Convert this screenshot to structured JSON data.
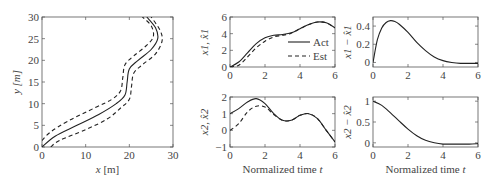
{
  "chart_data": [
    {
      "id": "trajectory",
      "type": "line",
      "xlabel": "x [m]",
      "ylabel": "y [m]",
      "xlim": [
        0,
        30
      ],
      "ylim": [
        0,
        30
      ],
      "xticks": [
        "0",
        "10",
        "20",
        "30"
      ],
      "yticks": [
        "0",
        "5",
        "10",
        "15",
        "20",
        "25",
        "30"
      ],
      "series": [
        {
          "name": "center",
          "style": "solid",
          "x": [
            0,
            3,
            8,
            13,
            17,
            19,
            19.5,
            20,
            22,
            25,
            26.5,
            26,
            24
          ],
          "y": [
            0,
            2.5,
            5,
            7.5,
            10,
            12,
            15,
            18,
            20,
            22.5,
            25,
            27.5,
            30
          ]
        },
        {
          "name": "left-bound",
          "style": "dashed",
          "x": [
            0,
            2,
            6,
            12,
            16,
            18,
            18.5,
            19,
            21,
            24,
            25.5,
            25,
            23
          ],
          "y": [
            1.5,
            3.5,
            6,
            9,
            11,
            13,
            16,
            19,
            21,
            23.5,
            25.5,
            28,
            30
          ]
        },
        {
          "name": "right-bound",
          "style": "dashed",
          "x": [
            2,
            4,
            10,
            15,
            18,
            20,
            20.5,
            21,
            23,
            26,
            27.5,
            27,
            25
          ],
          "y": [
            0,
            1.5,
            4,
            6.5,
            9,
            11,
            14,
            17,
            19,
            21.5,
            24.5,
            27,
            30
          ]
        }
      ]
    },
    {
      "id": "x1",
      "type": "line",
      "xlabel": "",
      "ylabel": "x1, x̂1",
      "xlim": [
        0,
        6
      ],
      "ylim": [
        0,
        6
      ],
      "xticks": [
        "0",
        "2",
        "4",
        "6"
      ],
      "yticks": [
        "0",
        "2",
        "4",
        "6"
      ],
      "legend": [
        "Act",
        "Est"
      ],
      "series": [
        {
          "name": "Act",
          "style": "solid",
          "x": [
            0,
            0.5,
            1,
            1.5,
            2,
            2.5,
            3,
            3.5,
            4,
            4.5,
            5,
            5.5,
            6
          ],
          "y": [
            0,
            0.6,
            1.7,
            2.8,
            3.5,
            3.8,
            3.9,
            4.1,
            4.6,
            5.1,
            5.4,
            5.3,
            4.7
          ]
        },
        {
          "name": "Est",
          "style": "dashed",
          "x": [
            0,
            0.5,
            1,
            1.5,
            2,
            2.5,
            3,
            3.5,
            4,
            4.5,
            5,
            5.5,
            6
          ],
          "y": [
            0,
            0.2,
            1.2,
            2.3,
            3.1,
            3.6,
            3.8,
            4.05,
            4.6,
            5.1,
            5.4,
            5.3,
            4.7
          ]
        }
      ]
    },
    {
      "id": "x1-err",
      "type": "line",
      "xlabel": "",
      "ylabel": "x1 − x̂1",
      "xlim": [
        0,
        6
      ],
      "ylim": [
        -0.05,
        0.5
      ],
      "xticks": [
        "0",
        "2",
        "4",
        "6"
      ],
      "yticks": [
        "0",
        "0.2",
        "0.4"
      ],
      "series": [
        {
          "name": "error",
          "style": "solid",
          "x": [
            0,
            0.25,
            0.5,
            0.75,
            1,
            1.25,
            1.5,
            2,
            2.5,
            3,
            3.5,
            4,
            4.5,
            5,
            5.5,
            6
          ],
          "y": [
            0,
            0.25,
            0.38,
            0.44,
            0.46,
            0.45,
            0.42,
            0.33,
            0.22,
            0.13,
            0.06,
            0.02,
            0,
            -0.01,
            -0.01,
            -0.01
          ]
        }
      ]
    },
    {
      "id": "x2",
      "type": "line",
      "xlabel": "Normalized time t",
      "ylabel": "x2, x̂2",
      "xlim": [
        0,
        6
      ],
      "ylim": [
        -1,
        2
      ],
      "xticks": [
        "0",
        "2",
        "4",
        "6"
      ],
      "yticks": [
        "−1",
        "0",
        "1",
        "2"
      ],
      "series": [
        {
          "name": "Act",
          "style": "solid",
          "x": [
            0,
            0.5,
            1,
            1.5,
            2,
            2.5,
            3,
            3.5,
            4,
            4.5,
            5,
            5.5,
            6
          ],
          "y": [
            1,
            1.3,
            1.7,
            1.9,
            1.6,
            1.0,
            0.6,
            0.6,
            0.9,
            1.0,
            0.7,
            0.0,
            -0.7
          ]
        },
        {
          "name": "Est",
          "style": "dashed",
          "x": [
            0,
            0.5,
            1,
            1.5,
            2,
            2.5,
            3,
            3.5,
            4,
            4.5,
            5,
            5.5,
            6
          ],
          "y": [
            0,
            0.4,
            1.1,
            1.45,
            1.4,
            0.95,
            0.6,
            0.6,
            0.9,
            1.0,
            0.7,
            0.0,
            -0.7
          ]
        }
      ]
    },
    {
      "id": "x2-err",
      "type": "line",
      "xlabel": "Normalized time t",
      "ylabel": "x2 − x̂2",
      "xlim": [
        0,
        6
      ],
      "ylim": [
        -0.1,
        1.1
      ],
      "xticks": [
        "0",
        "2",
        "4",
        "6"
      ],
      "yticks": [
        "0",
        "0.5",
        "1"
      ],
      "series": [
        {
          "name": "error",
          "style": "solid",
          "x": [
            0,
            0.5,
            1,
            1.5,
            2,
            2.5,
            3,
            3.5,
            4,
            4.5,
            5,
            5.5,
            6
          ],
          "y": [
            1,
            0.9,
            0.72,
            0.52,
            0.33,
            0.17,
            0.06,
            0,
            -0.03,
            -0.03,
            -0.03,
            -0.03,
            -0.02
          ]
        }
      ]
    }
  ]
}
